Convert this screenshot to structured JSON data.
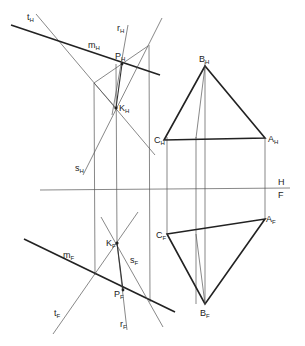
{
  "diagram": {
    "type": "descriptive-geometry-two-projections",
    "axis": {
      "upper_label": "H",
      "lower_label": "F",
      "y": 188
    },
    "labels": {
      "tH": {
        "main": "t",
        "sub": "H",
        "x": 27,
        "y": 20
      },
      "mH": {
        "main": "m",
        "sub": "H",
        "x": 88,
        "y": 48
      },
      "rH": {
        "main": "r",
        "sub": "H",
        "x": 117,
        "y": 31
      },
      "PH": {
        "main": "P",
        "sub": "H",
        "x": 115,
        "y": 59
      },
      "KH": {
        "main": "K",
        "sub": "H",
        "x": 119,
        "y": 111
      },
      "sH": {
        "main": "s",
        "sub": "H",
        "x": 75,
        "y": 171
      },
      "BH": {
        "main": "B",
        "sub": "H",
        "x": 203,
        "y": 63
      },
      "CH": {
        "main": "C",
        "sub": "H",
        "x": 158,
        "y": 142
      },
      "AH": {
        "main": "A",
        "sub": "H",
        "x": 267,
        "y": 142
      },
      "H": {
        "main": "H",
        "sub": "",
        "x": 277,
        "y": 185
      },
      "F": {
        "main": "F",
        "sub": "",
        "x": 277,
        "y": 197
      },
      "KF": {
        "main": "K",
        "sub": "F",
        "x": 106,
        "y": 246
      },
      "sF": {
        "main": "s",
        "sub": "F",
        "x": 130,
        "y": 263
      },
      "mF": {
        "main": "m",
        "sub": "F",
        "x": 63,
        "y": 258
      },
      "PF": {
        "main": "P",
        "sub": "F",
        "x": 114,
        "y": 297
      },
      "tF": {
        "main": "t",
        "sub": "F",
        "x": 54,
        "y": 316
      },
      "rF": {
        "main": "r",
        "sub": "F",
        "x": 120,
        "y": 327
      },
      "CF": {
        "main": "C",
        "sub": "F",
        "x": 158,
        "y": 238
      },
      "AF": {
        "main": "A",
        "sub": "F",
        "x": 266,
        "y": 222
      },
      "BF": {
        "main": "B",
        "sub": "F",
        "x": 203,
        "y": 316
      }
    },
    "colors": {
      "line": "#222222",
      "construction": "#555555",
      "background": "#ffffff"
    }
  }
}
